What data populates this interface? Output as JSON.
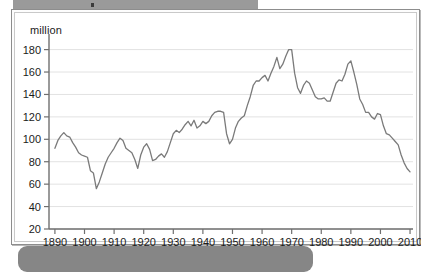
{
  "banner": {
    "top_label": "",
    "bottom_label": ""
  },
  "chart_data": {
    "type": "line",
    "title": "",
    "subtitle": "",
    "xlabel": "",
    "ylabel": "million",
    "unit_label": "million",
    "xlim": [
      1888,
      2011
    ],
    "ylim": [
      20,
      185
    ],
    "yticks": [
      20,
      40,
      60,
      80,
      100,
      120,
      140,
      160,
      180
    ],
    "ytick_labels": [
      "20",
      "40",
      "60",
      "80",
      "100",
      "120",
      "140",
      "160",
      "180"
    ],
    "xticks": [
      1890,
      1900,
      1910,
      1920,
      1930,
      1940,
      1950,
      1960,
      1970,
      1980,
      1990,
      2000,
      2010
    ],
    "xtick_labels": [
      "1890",
      "1900",
      "1910",
      "1920",
      "1930",
      "1940",
      "1950",
      "1960",
      "1970",
      "1980",
      "1990",
      "2000",
      "2010"
    ],
    "grid": true,
    "grid_axis": "y",
    "legend": false,
    "legend_position": "none",
    "line_color": "#7a7a7a",
    "annotations": [],
    "series": [
      {
        "name": "million",
        "x": [
          1890,
          1891,
          1892,
          1893,
          1894,
          1895,
          1896,
          1897,
          1898,
          1899,
          1900,
          1901,
          1902,
          1903,
          1904,
          1905,
          1906,
          1907,
          1908,
          1909,
          1910,
          1911,
          1912,
          1913,
          1914,
          1915,
          1916,
          1917,
          1918,
          1919,
          1920,
          1921,
          1922,
          1923,
          1924,
          1925,
          1926,
          1927,
          1928,
          1929,
          1930,
          1931,
          1932,
          1933,
          1934,
          1935,
          1936,
          1937,
          1938,
          1939,
          1940,
          1941,
          1942,
          1943,
          1944,
          1945,
          1946,
          1947,
          1948,
          1949,
          1950,
          1951,
          1952,
          1953,
          1954,
          1955,
          1956,
          1957,
          1958,
          1959,
          1960,
          1961,
          1962,
          1963,
          1964,
          1965,
          1966,
          1967,
          1968,
          1969,
          1970,
          1971,
          1972,
          1973,
          1974,
          1975,
          1976,
          1977,
          1978,
          1979,
          1980,
          1981,
          1982,
          1983,
          1984,
          1985,
          1986,
          1987,
          1988,
          1989,
          1990,
          1991,
          1992,
          1993,
          1994,
          1995,
          1996,
          1997,
          1998,
          1999,
          2000,
          2001,
          2002,
          2003,
          2004,
          2005,
          2006,
          2007,
          2008,
          2009,
          2010
        ],
        "values": [
          92,
          99,
          103,
          106,
          103,
          102,
          97,
          93,
          88,
          86,
          85,
          84,
          72,
          70,
          56,
          62,
          70,
          78,
          84,
          88,
          92,
          97,
          101,
          99,
          92,
          90,
          88,
          82,
          74,
          86,
          93,
          96,
          91,
          81,
          82,
          85,
          87,
          84,
          89,
          97,
          105,
          108,
          106,
          109,
          113,
          116,
          112,
          117,
          110,
          112,
          116,
          114,
          116,
          121,
          124,
          125,
          125,
          124,
          105,
          96,
          100,
          110,
          116,
          119,
          121,
          130,
          138,
          148,
          152,
          152,
          155,
          157,
          152,
          159,
          165,
          173,
          163,
          167,
          174,
          180,
          180,
          159,
          146,
          141,
          148,
          152,
          150,
          144,
          138,
          136,
          136,
          137,
          134,
          134,
          142,
          150,
          153,
          152,
          158,
          167,
          170,
          160,
          149,
          136,
          131,
          124,
          124,
          120,
          118,
          123,
          122,
          112,
          105,
          104,
          101,
          98,
          95,
          86,
          79,
          74,
          71
        ]
      }
    ]
  }
}
